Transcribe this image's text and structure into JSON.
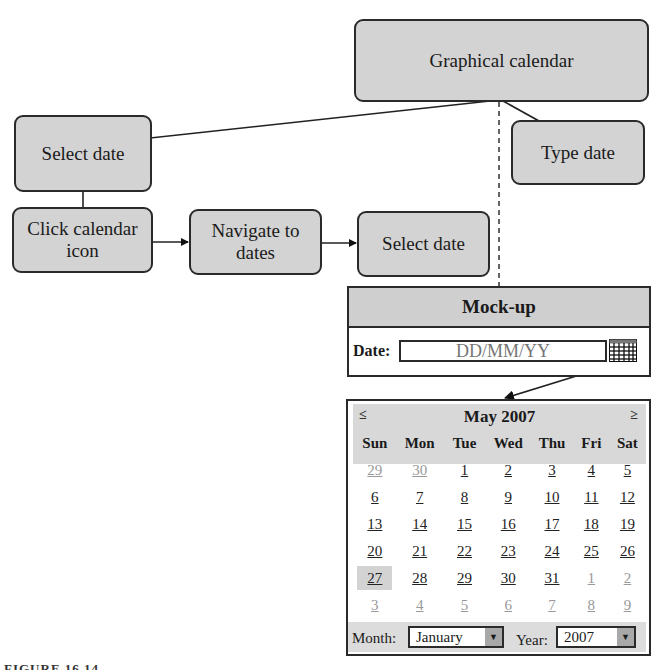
{
  "diagram": {
    "nodes": {
      "graphical_calendar": "Graphical calendar",
      "select_date_top": "Select date",
      "type_date": "Type date",
      "click_calendar_icon": "Click calendar icon",
      "navigate_to_dates": "Navigate to dates",
      "select_date_bottom": "Select date"
    }
  },
  "mockup": {
    "title": "Mock-up",
    "date_label": "Date:",
    "date_placeholder": "DD/MM/YY",
    "icon": "calendar-grid-icon"
  },
  "calendar": {
    "prev_label": "≤",
    "next_label": "≥",
    "title": "May 2007",
    "weekdays": [
      "Sun",
      "Mon",
      "Tue",
      "Wed",
      "Thu",
      "Fri",
      "Sat"
    ],
    "weeks": [
      [
        {
          "d": "29",
          "other": true
        },
        {
          "d": "30",
          "other": true
        },
        {
          "d": "1"
        },
        {
          "d": "2"
        },
        {
          "d": "3"
        },
        {
          "d": "4"
        },
        {
          "d": "5"
        }
      ],
      [
        {
          "d": "6"
        },
        {
          "d": "7"
        },
        {
          "d": "8"
        },
        {
          "d": "9"
        },
        {
          "d": "10"
        },
        {
          "d": "11"
        },
        {
          "d": "12"
        }
      ],
      [
        {
          "d": "13"
        },
        {
          "d": "14"
        },
        {
          "d": "15"
        },
        {
          "d": "16"
        },
        {
          "d": "17"
        },
        {
          "d": "18"
        },
        {
          "d": "19"
        }
      ],
      [
        {
          "d": "20"
        },
        {
          "d": "21"
        },
        {
          "d": "22"
        },
        {
          "d": "23"
        },
        {
          "d": "24"
        },
        {
          "d": "25"
        },
        {
          "d": "26"
        }
      ],
      [
        {
          "d": "27",
          "today": true
        },
        {
          "d": "28"
        },
        {
          "d": "29"
        },
        {
          "d": "30"
        },
        {
          "d": "31"
        },
        {
          "d": "1",
          "other": true
        },
        {
          "d": "2",
          "other": true
        }
      ],
      [
        {
          "d": "3",
          "other": true
        },
        {
          "d": "4",
          "other": true
        },
        {
          "d": "5",
          "other": true
        },
        {
          "d": "6",
          "other": true
        },
        {
          "d": "7",
          "other": true
        },
        {
          "d": "8",
          "other": true
        },
        {
          "d": "9",
          "other": true
        }
      ]
    ],
    "month_label": "Month:",
    "month_value": "January",
    "year_label": "Year:",
    "year_value": "2007"
  },
  "caption": "FIGURE 16.14"
}
